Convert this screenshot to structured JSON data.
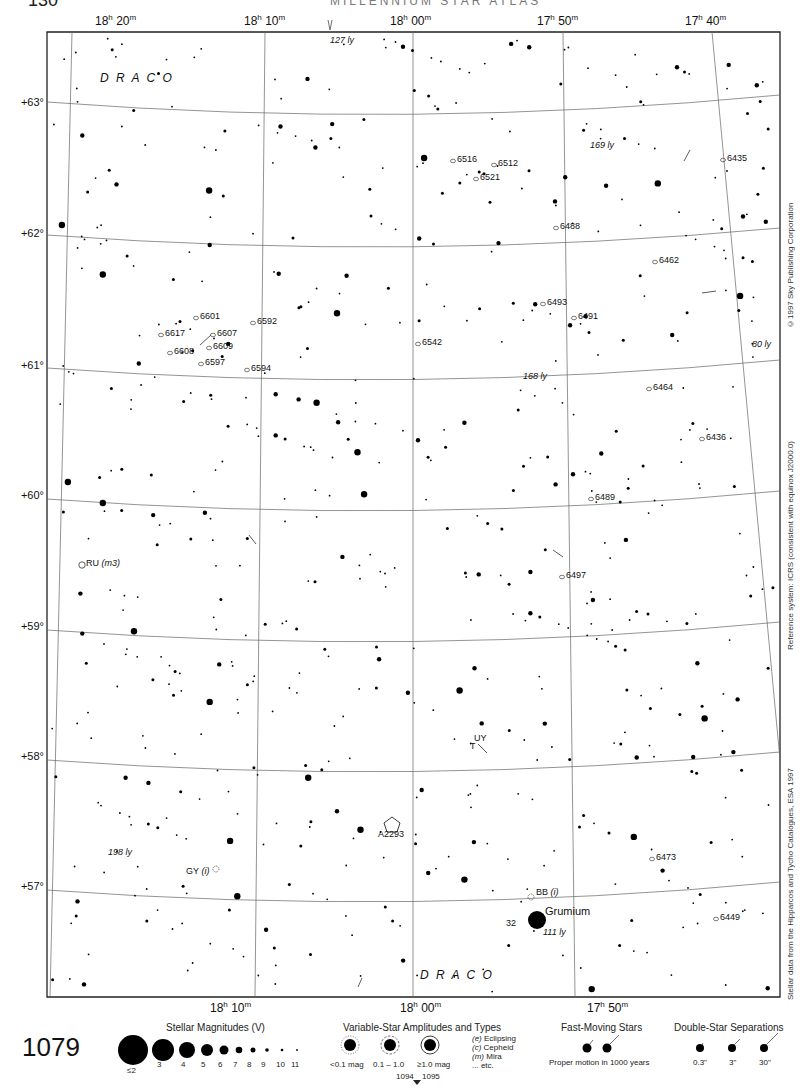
{
  "header": {
    "page_number": "130",
    "running_title": "MILLENNIUM STAR ATLAS"
  },
  "chart": {
    "number": "1079",
    "constellation_labels": [
      {
        "text": "D R A C O",
        "x": 100,
        "y": 78
      },
      {
        "text": "D R A C O",
        "x": 420,
        "y": 975
      }
    ],
    "ra_labels_top": [
      {
        "h": "18",
        "m": "20",
        "x": 95
      },
      {
        "h": "18",
        "m": "10",
        "x": 244
      },
      {
        "h": "18",
        "m": "00",
        "x": 390
      },
      {
        "h": "17",
        "m": "50",
        "x": 537
      },
      {
        "h": "17",
        "m": "40",
        "x": 685
      }
    ],
    "ra_labels_bottom": [
      {
        "h": "18",
        "m": "10",
        "x": 210
      },
      {
        "h": "18",
        "m": "00",
        "x": 400
      },
      {
        "h": "17",
        "m": "50",
        "x": 587
      }
    ],
    "dec_labels": [
      {
        "text": "+63°",
        "y": 103
      },
      {
        "text": "+62°",
        "y": 234
      },
      {
        "text": "+61°",
        "y": 366
      },
      {
        "text": "+60°",
        "y": 496
      },
      {
        "text": "+59°",
        "y": 627
      },
      {
        "text": "+58°",
        "y": 757
      },
      {
        "text": "+57°",
        "y": 887
      }
    ],
    "galaxy_labels": [
      {
        "text": "6516",
        "x": 457,
        "y": 161
      },
      {
        "text": "6512",
        "x": 498,
        "y": 165
      },
      {
        "text": "6521",
        "x": 480,
        "y": 179
      },
      {
        "text": "6488",
        "x": 560,
        "y": 228
      },
      {
        "text": "6435",
        "x": 727,
        "y": 160
      },
      {
        "text": "6462",
        "x": 659,
        "y": 262
      },
      {
        "text": "6493",
        "x": 547,
        "y": 304
      },
      {
        "text": "6491",
        "x": 578,
        "y": 318
      },
      {
        "text": "6601",
        "x": 200,
        "y": 318
      },
      {
        "text": "6592",
        "x": 257,
        "y": 323
      },
      {
        "text": "6617",
        "x": 165,
        "y": 335
      },
      {
        "text": "6607",
        "x": 217,
        "y": 335
      },
      {
        "text": "6608",
        "x": 174,
        "y": 353
      },
      {
        "text": "6609",
        "x": 213,
        "y": 348
      },
      {
        "text": "6597",
        "x": 205,
        "y": 364
      },
      {
        "text": "6594",
        "x": 251,
        "y": 370
      },
      {
        "text": "6542",
        "x": 422,
        "y": 344
      },
      {
        "text": "6464",
        "x": 653,
        "y": 389
      },
      {
        "text": "6436",
        "x": 706,
        "y": 439
      },
      {
        "text": "6489",
        "x": 595,
        "y": 499
      },
      {
        "text": "6497",
        "x": 566,
        "y": 577
      },
      {
        "text": "6473",
        "x": 656,
        "y": 859
      },
      {
        "text": "6449",
        "x": 720,
        "y": 919
      }
    ],
    "variable_star_labels": [
      {
        "text": "RU",
        "italic": "(m3)",
        "x": 86,
        "y": 565
      },
      {
        "text": "GY",
        "italic": "(i)",
        "x": 186,
        "y": 873
      },
      {
        "text": "BB",
        "italic": "(i)",
        "x": 536,
        "y": 894
      }
    ],
    "distance_labels": [
      {
        "text": "127 ly",
        "x": 330,
        "y": 42
      },
      {
        "text": "169 ly",
        "x": 590,
        "y": 147
      },
      {
        "text": "168 ly",
        "x": 523,
        "y": 378
      },
      {
        "text": "80 ly",
        "x": 752,
        "y": 346
      },
      {
        "text": "198 ly",
        "x": 108,
        "y": 854
      },
      {
        "text": "111 ly",
        "x": 543,
        "y": 934
      }
    ],
    "named_objects": [
      {
        "text": "Grumium",
        "x": 545,
        "y": 912
      },
      {
        "text": "32",
        "x": 506,
        "y": 925
      },
      {
        "text": "UY",
        "x": 474,
        "y": 740
      },
      {
        "text": "T",
        "x": 470,
        "y": 748
      },
      {
        "text": "A2293",
        "x": 378,
        "y": 836
      }
    ],
    "side_notes": {
      "copyright": "©1997 Sky Publishing Corporation",
      "reference": "Reference system: ICRS (consistent with equinox J2000.0)",
      "data_source": "Stellar data from the Hipparcos and Tycho Catalogues, ESA 1997"
    }
  },
  "legend": {
    "magnitudes": {
      "title": "Stellar Magnitudes (V)",
      "items": [
        "≤2",
        "3",
        "4",
        "5",
        "6",
        "7",
        "8",
        "9",
        "10",
        "11"
      ]
    },
    "variable_stars": {
      "title": "Variable-Star Amplitudes and Types",
      "amplitudes": [
        "<0.1 mag",
        "0.1 – 1.0",
        "≥1.0 mag"
      ],
      "types": [
        {
          "code": "(e)",
          "name": "Eclipsing"
        },
        {
          "code": "(c)",
          "name": "Cepheid"
        },
        {
          "code": "(m)",
          "name": "Mira"
        },
        {
          "code": "",
          "name": "... etc."
        }
      ]
    },
    "fast_moving": {
      "title": "Fast-Moving Stars",
      "caption": "Proper motion in 1000 years"
    },
    "double_stars": {
      "title": "Double-Star Separations",
      "items": [
        "0.3\"",
        "3\"",
        "30\""
      ]
    },
    "adjacent_charts": {
      "left": "1094",
      "right": "1095"
    }
  }
}
